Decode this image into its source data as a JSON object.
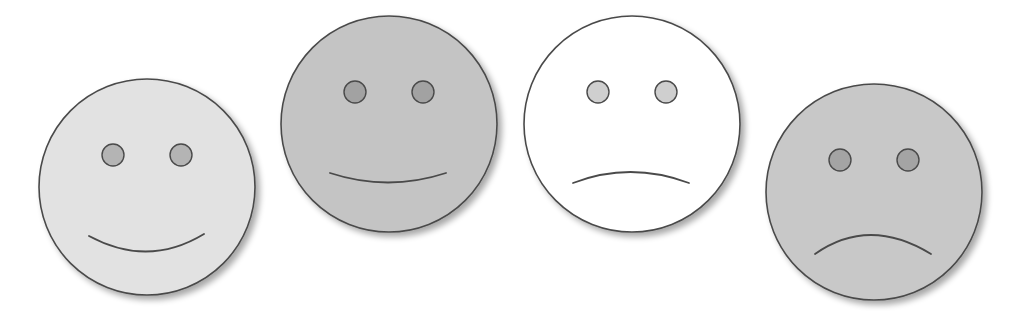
{
  "faces": [
    {
      "id": "face-1",
      "expression": "big-smile",
      "cx": 147,
      "cy": 187,
      "r": 108,
      "fill": "#e2e2e2",
      "eye_fill": "#b4b4b4",
      "mouth": "M 89 236 Q 148 268 204 234"
    },
    {
      "id": "face-2",
      "expression": "slight-smile",
      "cx": 389,
      "cy": 124,
      "r": 108,
      "fill": "#c4c4c4",
      "eye_fill": "#a2a2a2",
      "mouth": "M 330 173 Q 388 192 446 173"
    },
    {
      "id": "face-3",
      "expression": "slight-frown",
      "cx": 632,
      "cy": 124,
      "r": 108,
      "fill": "#ffffff",
      "eye_fill": "#cfcfcf",
      "mouth": "M 573 183 Q 630 161 689 183"
    },
    {
      "id": "face-4",
      "expression": "frown",
      "cx": 874,
      "cy": 192,
      "r": 108,
      "fill": "#c8c8c8",
      "eye_fill": "#a4a4a4",
      "mouth": "M 815 254 Q 869 216 931 254"
    }
  ],
  "colors": {
    "outline": "#4a4a4a",
    "shadow": "#bcbcbc",
    "background": "#ffffff"
  }
}
